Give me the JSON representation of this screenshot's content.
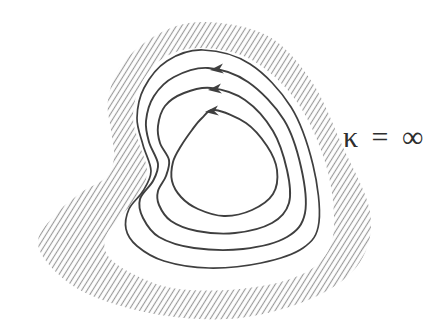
{
  "figure": {
    "region_label": "κ = ∞",
    "streamlines_with_arrows": 3,
    "arrow_direction": "counterclockwise"
  },
  "colors": {
    "ink": "#3f3f3f",
    "hatch": "#9a9a9a",
    "background": "#ffffff",
    "label-ink": "#2e2e2e"
  }
}
